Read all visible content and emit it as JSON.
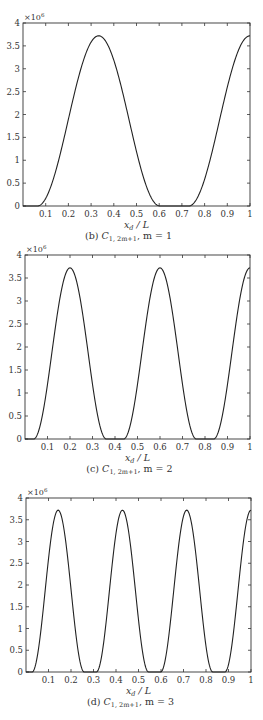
{
  "chart_data": [
    {
      "type": "line",
      "panel": "b",
      "caption": "(b) C1, 2m+1, m = 1",
      "caption_parts": {
        "prefix": "(b) ",
        "symbol": "C",
        "subscript": "1, 2m+1",
        "suffix": ", m = 1"
      },
      "xlabel": "x_d / L",
      "ylabel": "",
      "y_multiplier": "×10^6",
      "xlim": [
        0,
        1
      ],
      "ylim": [
        0,
        4
      ],
      "xticks": [
        "0.1",
        "0.2",
        "0.3",
        "0.4",
        "0.5",
        "0.6",
        "0.7",
        "0.8",
        "0.9",
        "1"
      ],
      "yticks": [
        "0",
        "0.5",
        "1",
        "1.5",
        "2",
        "2.5",
        "3",
        "3.5",
        "4"
      ],
      "grid": false,
      "peak_value": 3.72,
      "peaks_x": [
        0.3333,
        1.0
      ],
      "half_width": 0.27,
      "x": [
        0,
        0.05,
        0.1,
        0.15,
        0.2,
        0.25,
        0.3,
        0.35,
        0.4,
        0.45,
        0.5,
        0.55,
        0.6,
        0.65,
        0.7,
        0.75,
        0.8,
        0.85,
        0.9,
        0.95,
        1.0
      ],
      "values": [
        0,
        0,
        0.17,
        0.87,
        1.9,
        2.91,
        3.58,
        3.68,
        3.19,
        2.25,
        1.19,
        0.35,
        0,
        0,
        0,
        0.05,
        0.58,
        1.54,
        2.6,
        3.41,
        3.72
      ]
    },
    {
      "type": "line",
      "panel": "c",
      "caption": "(c) C1, 2m+1, m = 2",
      "caption_parts": {
        "prefix": "(c) ",
        "symbol": "C",
        "subscript": "1, 2m+1",
        "suffix": ", m = 2"
      },
      "xlabel": "x_d / L",
      "ylabel": "",
      "y_multiplier": "×10^6",
      "xlim": [
        0,
        1
      ],
      "ylim": [
        0,
        4
      ],
      "xticks": [
        "0.1",
        "0.2",
        "0.3",
        "0.4",
        "0.5",
        "0.6",
        "0.7",
        "0.8",
        "0.9",
        "1"
      ],
      "yticks": [
        "0",
        "0.5",
        "1",
        "1.5",
        "2",
        "2.5",
        "3",
        "3.5",
        "4"
      ],
      "grid": false,
      "peak_value": 3.72,
      "peaks_x": [
        0.2,
        0.6,
        1.0
      ],
      "half_width": 0.162,
      "x": [
        0,
        0.05,
        0.1,
        0.15,
        0.2,
        0.25,
        0.3,
        0.35,
        0.4,
        0.45,
        0.5,
        0.55,
        0.6,
        0.65,
        0.7,
        0.75,
        0.8,
        0.85,
        0.9,
        0.95,
        1.0
      ],
      "values": [
        0,
        0.05,
        1.19,
        2.91,
        3.72,
        2.91,
        1.19,
        0.05,
        0,
        0.05,
        1.19,
        2.91,
        3.72,
        2.91,
        1.19,
        0.05,
        0,
        0.05,
        1.19,
        2.91,
        3.72
      ]
    },
    {
      "type": "line",
      "panel": "d",
      "caption": "(d) C1, 2m+1, m = 3",
      "caption_parts": {
        "prefix": "(d) ",
        "symbol": "C",
        "subscript": "1, 2m+1",
        "suffix": ", m = 3"
      },
      "xlabel": "x_d / L",
      "ylabel": "",
      "y_multiplier": "×10^6",
      "xlim": [
        0,
        1
      ],
      "ylim": [
        0,
        4
      ],
      "xticks": [
        "0.1",
        "0.2",
        "0.3",
        "0.4",
        "0.5",
        "0.6",
        "0.7",
        "0.8",
        "0.9",
        "1"
      ],
      "yticks": [
        "0",
        "0.5",
        "1",
        "1.5",
        "2",
        "2.5",
        "3",
        "3.5",
        "4"
      ],
      "grid": false,
      "peak_value": 3.72,
      "peaks_x": [
        0.1429,
        0.4286,
        0.7143,
        1.0
      ],
      "half_width": 0.116,
      "x": [
        0,
        0.05,
        0.1,
        0.15,
        0.2,
        0.25,
        0.3,
        0.35,
        0.4,
        0.45,
        0.5,
        0.55,
        0.6,
        0.65,
        0.7,
        0.75,
        0.8,
        0.85,
        0.9,
        0.95,
        1.0
      ],
      "values": [
        0,
        0.42,
        2.1,
        3.7,
        1.55,
        0.02,
        0,
        1.03,
        3.19,
        3.19,
        0.52,
        0,
        0.38,
        2.62,
        3.7,
        1.55,
        0.02,
        0,
        1.04,
        3.2,
        3.72
      ]
    }
  ],
  "panels": [
    {
      "top": 23,
      "bottom": 206,
      "left": 23,
      "right": 250
    },
    {
      "top": 255,
      "bottom": 439,
      "left": 25,
      "right": 250
    },
    {
      "top": 498,
      "bottom": 672,
      "left": 26,
      "right": 251
    }
  ]
}
